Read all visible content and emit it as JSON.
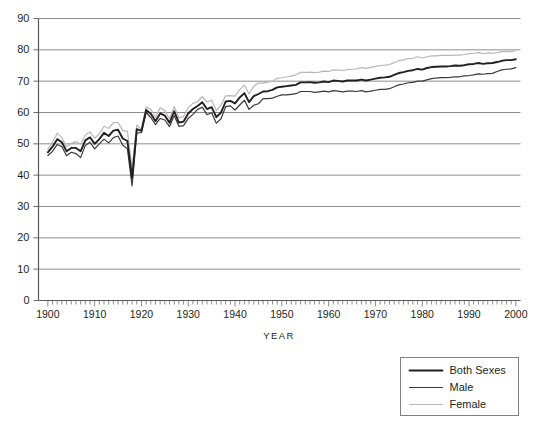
{
  "chart_data": {
    "type": "line",
    "title": "",
    "subtitle": "",
    "xlabel": "YEAR",
    "ylabel": "",
    "xlim": [
      1898,
      2001
    ],
    "ylim": [
      0,
      90
    ],
    "grid": "horizontal",
    "legend_position": "bottom-right",
    "x_tick_labels": [
      "1900",
      "1910",
      "1920",
      "1930",
      "1940",
      "1950",
      "1960",
      "1970",
      "1980",
      "1990",
      "2000"
    ],
    "x_tick_values": [
      1900,
      1910,
      1920,
      1930,
      1940,
      1950,
      1960,
      1970,
      1980,
      1990,
      2000
    ],
    "x_minor_tick_step": 1,
    "y_tick_labels": [
      "0",
      "10",
      "20",
      "30",
      "40",
      "50",
      "60",
      "70",
      "80",
      "90"
    ],
    "y_tick_values": [
      0,
      10,
      20,
      30,
      40,
      50,
      60,
      70,
      80,
      90
    ],
    "x": [
      1900,
      1901,
      1902,
      1903,
      1904,
      1905,
      1906,
      1907,
      1908,
      1909,
      1910,
      1911,
      1912,
      1913,
      1914,
      1915,
      1916,
      1917,
      1918,
      1919,
      1920,
      1921,
      1922,
      1923,
      1924,
      1925,
      1926,
      1927,
      1928,
      1929,
      1930,
      1931,
      1932,
      1933,
      1934,
      1935,
      1936,
      1937,
      1938,
      1939,
      1940,
      1941,
      1942,
      1943,
      1944,
      1945,
      1946,
      1947,
      1948,
      1949,
      1950,
      1951,
      1952,
      1953,
      1954,
      1955,
      1956,
      1957,
      1958,
      1959,
      1960,
      1961,
      1962,
      1963,
      1964,
      1965,
      1966,
      1967,
      1968,
      1969,
      1970,
      1971,
      1972,
      1973,
      1974,
      1975,
      1976,
      1977,
      1978,
      1979,
      1980,
      1981,
      1982,
      1983,
      1984,
      1985,
      1986,
      1987,
      1988,
      1989,
      1990,
      1991,
      1992,
      1993,
      1994,
      1995,
      1996,
      1997,
      1998,
      1999,
      2000
    ],
    "series": [
      {
        "name": "Both Sexes",
        "color": "#231f20",
        "width": 1.9,
        "values": [
          47.3,
          49.1,
          51.5,
          50.5,
          47.6,
          48.7,
          48.7,
          47.6,
          51.1,
          52.1,
          50.0,
          51.5,
          53.5,
          52.5,
          54.2,
          54.5,
          51.7,
          50.9,
          39.1,
          54.7,
          54.1,
          60.8,
          59.6,
          57.2,
          59.7,
          59.0,
          56.7,
          60.4,
          56.8,
          57.1,
          59.7,
          61.1,
          62.1,
          63.3,
          61.1,
          61.7,
          58.5,
          60.0,
          63.5,
          63.7,
          62.9,
          64.8,
          66.2,
          63.3,
          65.2,
          65.9,
          66.7,
          66.8,
          67.2,
          68.0,
          68.2,
          68.4,
          68.6,
          68.8,
          69.6,
          69.6,
          69.7,
          69.5,
          69.6,
          69.9,
          69.7,
          70.2,
          70.1,
          69.9,
          70.2,
          70.2,
          70.2,
          70.5,
          70.2,
          70.5,
          70.8,
          71.1,
          71.2,
          71.4,
          72.0,
          72.6,
          72.9,
          73.3,
          73.5,
          73.9,
          73.7,
          74.2,
          74.5,
          74.6,
          74.7,
          74.7,
          74.8,
          75.0,
          74.9,
          75.1,
          75.4,
          75.5,
          75.8,
          75.5,
          75.7,
          75.8,
          76.1,
          76.5,
          76.7,
          76.7,
          77.0
        ]
      },
      {
        "name": "Male",
        "color": "#3a3a3a",
        "width": 1.2,
        "values": [
          46.3,
          47.6,
          49.8,
          49.1,
          46.2,
          47.3,
          46.9,
          45.6,
          49.5,
          50.5,
          48.4,
          50.0,
          51.5,
          50.3,
          52.0,
          52.5,
          49.6,
          48.4,
          36.6,
          53.5,
          53.6,
          60.0,
          58.4,
          56.1,
          58.1,
          57.6,
          55.5,
          59.0,
          55.6,
          55.8,
          58.1,
          59.4,
          61.0,
          61.7,
          59.3,
          59.9,
          56.6,
          58.0,
          61.9,
          62.1,
          60.8,
          62.4,
          63.9,
          61.0,
          62.3,
          62.8,
          64.4,
          64.4,
          64.6,
          65.2,
          65.6,
          65.6,
          65.8,
          66.0,
          66.7,
          66.7,
          66.7,
          66.4,
          66.6,
          66.8,
          66.6,
          67.0,
          66.8,
          66.6,
          66.8,
          66.8,
          66.7,
          67.0,
          66.6,
          66.8,
          67.1,
          67.4,
          67.4,
          67.6,
          68.2,
          68.8,
          69.1,
          69.5,
          69.6,
          70.0,
          70.0,
          70.4,
          70.8,
          71.0,
          71.1,
          71.1,
          71.2,
          71.4,
          71.4,
          71.7,
          71.8,
          72.0,
          72.3,
          72.2,
          72.4,
          72.5,
          73.1,
          73.6,
          73.8,
          73.9,
          74.3
        ]
      },
      {
        "name": "Female",
        "color": "#b8b8b8",
        "width": 1.2,
        "values": [
          48.3,
          50.6,
          53.4,
          51.9,
          49.1,
          50.2,
          50.8,
          49.9,
          52.8,
          53.8,
          51.8,
          53.2,
          55.6,
          54.9,
          56.8,
          56.8,
          54.3,
          54.0,
          42.2,
          56.0,
          54.6,
          61.8,
          61.0,
          58.5,
          61.5,
          60.6,
          58.0,
          61.9,
          58.3,
          58.7,
          61.6,
          62.9,
          63.5,
          65.1,
          63.3,
          63.9,
          60.6,
          62.4,
          65.3,
          65.4,
          65.2,
          67.3,
          68.8,
          65.9,
          68.4,
          69.4,
          69.4,
          69.7,
          70.0,
          70.9,
          71.1,
          71.4,
          71.6,
          72.0,
          72.8,
          72.8,
          72.9,
          72.7,
          72.9,
          73.2,
          73.1,
          73.6,
          73.5,
          73.4,
          73.7,
          73.8,
          73.9,
          74.3,
          74.1,
          74.4,
          74.7,
          75.0,
          75.1,
          75.3,
          75.9,
          76.6,
          76.8,
          77.2,
          77.3,
          77.8,
          77.4,
          77.8,
          78.1,
          78.1,
          78.2,
          78.2,
          78.2,
          78.3,
          78.3,
          78.5,
          78.8,
          78.9,
          79.1,
          78.8,
          79.0,
          78.9,
          79.1,
          79.4,
          79.5,
          79.4,
          79.7
        ]
      }
    ],
    "annotations": []
  },
  "legend": {
    "entries": [
      {
        "label": "Both Sexes"
      },
      {
        "label": "Male"
      },
      {
        "label": "Female"
      }
    ]
  }
}
